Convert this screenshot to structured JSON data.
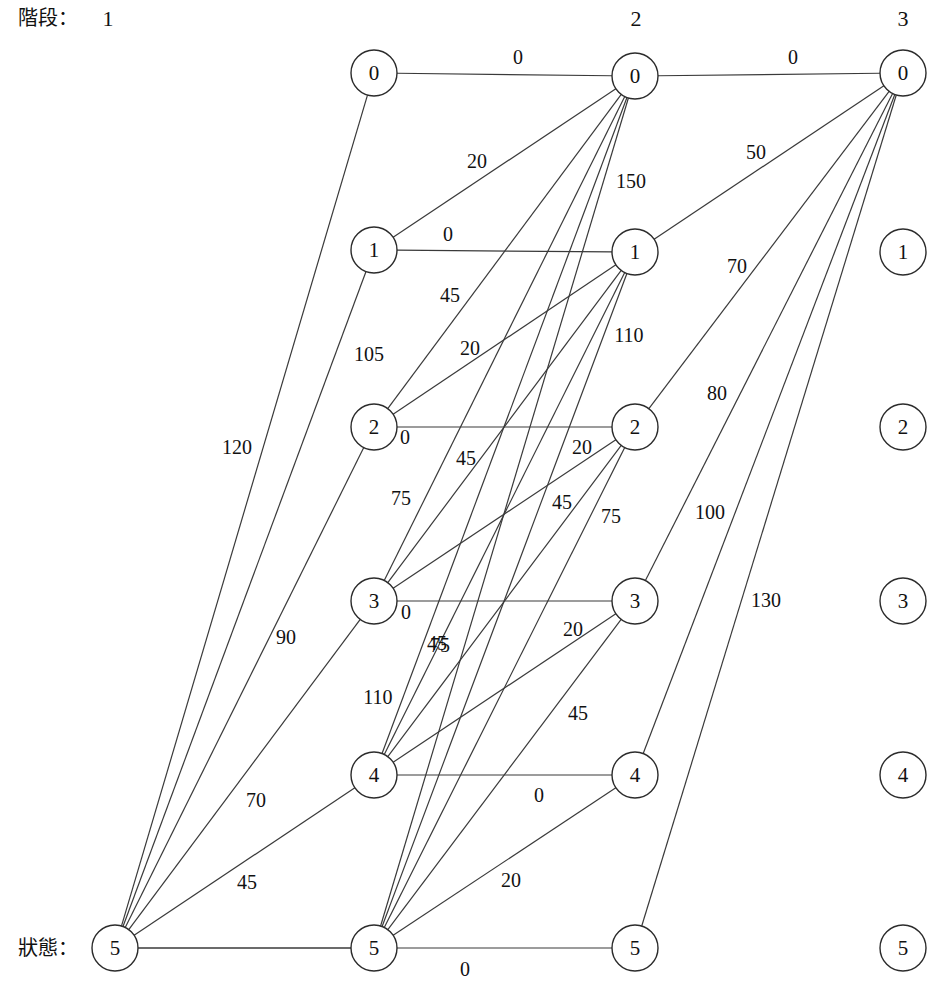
{
  "diagram": {
    "title_stage_label": "階段：",
    "title_state_label": "狀態：",
    "column_headers": [
      "1",
      "2",
      "3"
    ],
    "node_radius": 23,
    "columns": [
      {
        "index": 1,
        "x": 374,
        "nodes": [
          {
            "state": "0",
            "y": 73
          },
          {
            "state": "1",
            "y": 250
          },
          {
            "state": "2",
            "y": 427
          },
          {
            "state": "3",
            "y": 601
          },
          {
            "state": "4",
            "y": 775
          },
          {
            "state": "5",
            "y": 948
          }
        ]
      },
      {
        "index": 2,
        "x": 635,
        "nodes": [
          {
            "state": "0",
            "y": 76
          },
          {
            "state": "1",
            "y": 252
          },
          {
            "state": "2",
            "y": 427
          },
          {
            "state": "3",
            "y": 601
          },
          {
            "state": "4",
            "y": 775
          },
          {
            "state": "5",
            "y": 948
          }
        ]
      },
      {
        "index": 3,
        "x": 903,
        "nodes": [
          {
            "state": "0",
            "y": 73
          },
          {
            "state": "1",
            "y": 252
          },
          {
            "state": "2",
            "y": 427
          },
          {
            "state": "3",
            "y": 601
          },
          {
            "state": "4",
            "y": 775
          },
          {
            "state": "5",
            "y": 948
          }
        ]
      }
    ],
    "edges_col1_to_col2": [
      {
        "from": 0,
        "to": 0,
        "weight": "0",
        "lx": 518,
        "ly": 57
      },
      {
        "from": 1,
        "to": 0,
        "weight": "20",
        "lx": 477,
        "ly": 161
      },
      {
        "from": 2,
        "to": 0,
        "weight": "20",
        "lx": 470,
        "ly": 348
      },
      {
        "from": 3,
        "to": 0,
        "weight": "45",
        "lx": 466,
        "ly": 458
      },
      {
        "from": 4,
        "to": 0,
        "weight": "45",
        "lx": 437,
        "ly": 643
      },
      {
        "from": 5,
        "to": 0,
        "weight": "150",
        "lx": 631,
        "ly": 181
      },
      {
        "from": 1,
        "to": 1,
        "weight": "0",
        "lx": 448,
        "ly": 234
      },
      {
        "from": 2,
        "to": 1,
        "weight": "45",
        "lx": 450,
        "ly": 295
      },
      {
        "from": 3,
        "to": 1,
        "weight": "75",
        "lx": 401,
        "ly": 498
      },
      {
        "from": 4,
        "to": 1,
        "weight": "75",
        "lx": 440,
        "ly": 645
      },
      {
        "from": 5,
        "to": 1,
        "weight": "110",
        "lx": 629,
        "ly": 335
      },
      {
        "from": 2,
        "to": 2,
        "weight": "0",
        "lx": 405,
        "ly": 437
      },
      {
        "from": 3,
        "to": 2,
        "weight": "20",
        "lx": 582,
        "ly": 447
      },
      {
        "from": 4,
        "to": 2,
        "weight": "45",
        "lx": 562,
        "ly": 502
      },
      {
        "from": 5,
        "to": 2,
        "weight": "75",
        "lx": 611,
        "ly": 516
      },
      {
        "from": 3,
        "to": 3,
        "weight": "0",
        "lx": 406,
        "ly": 612
      },
      {
        "from": 4,
        "to": 3,
        "weight": "20",
        "lx": 573,
        "ly": 629
      },
      {
        "from": 5,
        "to": 3,
        "weight": "45",
        "lx": 578,
        "ly": 713
      },
      {
        "from": 4,
        "to": 4,
        "weight": "0",
        "lx": 539,
        "ly": 795
      },
      {
        "from": 5,
        "to": 4,
        "weight": "20",
        "lx": 511,
        "ly": 880
      },
      {
        "from": 5,
        "to": 5,
        "weight": "0",
        "lx": 465,
        "ly": 969
      }
    ],
    "edges_col0_to_col1": [
      {
        "to": 0,
        "weight": "120",
        "lx": 237,
        "ly": 447
      },
      {
        "to": 2,
        "weight": "105",
        "lx": 369,
        "ly": 354
      },
      {
        "to": 3,
        "weight": "90",
        "lx": 286,
        "ly": 637
      },
      {
        "to": 4,
        "weight": "70",
        "lx": 256,
        "ly": 800
      },
      {
        "to": 5,
        "weight": "45",
        "lx": 247,
        "ly": 882
      },
      {
        "to": 1,
        "weight": "110",
        "lx": 378,
        "ly": 697
      }
    ],
    "edges_col2_to_col3": [
      {
        "from": 0,
        "to": 0,
        "weight": "0",
        "lx": 793,
        "ly": 57
      },
      {
        "from": 1,
        "to": 0,
        "weight": "50",
        "lx": 756,
        "ly": 152
      },
      {
        "from": 2,
        "to": 0,
        "weight": "70",
        "lx": 737,
        "ly": 266
      },
      {
        "from": 3,
        "to": 0,
        "weight": "80",
        "lx": 717,
        "ly": 393
      },
      {
        "from": 4,
        "to": 0,
        "weight": "100",
        "lx": 710,
        "ly": 512
      },
      {
        "from": 5,
        "to": 0,
        "weight": "130",
        "lx": 766,
        "ly": 600
      }
    ]
  }
}
